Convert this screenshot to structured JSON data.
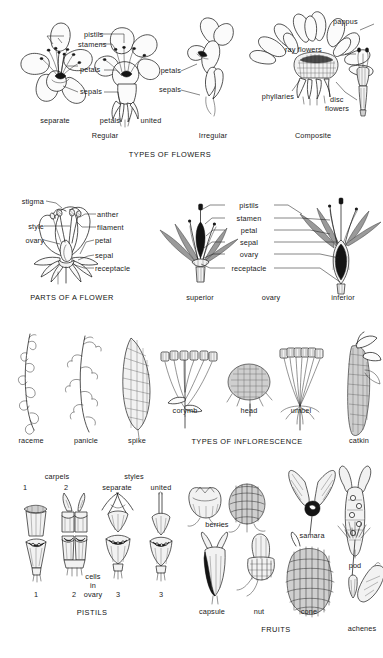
{
  "page": {
    "background": "#ffffff",
    "ink_color": "#1b1b1b"
  },
  "sections": [
    {
      "id": "types-of-flowers",
      "heading": "TYPES OF FLOWERS",
      "subgroups": [
        "Regular",
        "Irregular",
        "Composite"
      ],
      "specimens": [
        "separate",
        "petals",
        "united"
      ],
      "callouts": [
        "pistils",
        "stamens",
        "petals",
        "sepals",
        "petals",
        "sepals",
        "pappus",
        "ray flowers",
        "phyllaries",
        "disc",
        "flowers"
      ]
    },
    {
      "id": "parts-of-a-flower",
      "heading": "PARTS OF A FLOWER",
      "callouts": [
        "stigma",
        "style",
        "ovary",
        "anther",
        "filament",
        "petal",
        "sepal",
        "receptacle"
      ]
    },
    {
      "id": "ovary-position",
      "heading": "ovary",
      "specimens": [
        "superior",
        "inferior"
      ],
      "callouts": [
        "pistils",
        "stamen",
        "petal",
        "sepal",
        "ovary",
        "receptacle"
      ]
    },
    {
      "id": "types-of-inflorescence",
      "heading": "TYPES OF INFLORESCENCE",
      "specimens": [
        "raceme",
        "panicle",
        "spike",
        "corymb",
        "head",
        "umbel",
        "catkin"
      ]
    },
    {
      "id": "pistils",
      "heading": "PISTILS",
      "group_labels": [
        "carpels",
        "styles"
      ],
      "style_types": [
        "separate",
        "united"
      ],
      "top_numbers": [
        "1",
        "2"
      ],
      "bottom_numbers": [
        "1",
        "2",
        "3",
        "3"
      ],
      "cells_label": [
        "cells",
        "in",
        "ovary"
      ]
    },
    {
      "id": "fruits",
      "heading": "FRUITS",
      "specimens": [
        "berries",
        "samara",
        "pod",
        "capsule",
        "nut",
        "cone",
        "achenes"
      ]
    }
  ],
  "labels": {
    "flowers": {
      "pistils": "pistils",
      "stamens": "stamens",
      "petals": "petals",
      "sepals": "sepals",
      "separate": "separate",
      "petals_mid": "petals",
      "united": "united",
      "regular": "Regular",
      "irregular_petals": "petals",
      "irregular_sepals": "sepals",
      "irregular": "Irregular",
      "pappus": "pappus",
      "ray_flowers": "ray flowers",
      "phyllaries": "phyllaries",
      "disc": "disc",
      "flowers": "flowers",
      "composite": "Composite",
      "heading": "TYPES OF FLOWERS"
    },
    "parts": {
      "stigma": "stigma",
      "style": "style",
      "ovary": "ovary",
      "anther": "anther",
      "filament": "filament",
      "petal": "petal",
      "sepal": "sepal",
      "receptacle": "receptacle",
      "heading": "PARTS OF A FLOWER"
    },
    "ovary": {
      "pistils": "pistils",
      "stamen": "stamen",
      "petal": "petal",
      "sepal": "sepal",
      "ovary": "ovary",
      "receptacle": "receptacle",
      "superior": "superior",
      "heading": "ovary",
      "inferior": "inferior"
    },
    "inflorescence": {
      "raceme": "raceme",
      "panicle": "panicle",
      "spike": "spike",
      "corymb": "corymb",
      "head": "head",
      "umbel": "umbel",
      "catkin": "catkin",
      "heading": "TYPES OF INFLORESCENCE"
    },
    "pistils": {
      "carpels": "carpels",
      "styles": "styles",
      "n1_top": "1",
      "n2_top": "2",
      "separate": "separate",
      "united": "united",
      "cells": "cells",
      "in": "in",
      "ovary": "ovary",
      "n1_bot": "1",
      "n2_bot": "2",
      "n3_bot": "3",
      "n3b_bot": "3",
      "heading": "PISTILS"
    },
    "fruits": {
      "berries": "berries",
      "samara": "samara",
      "pod": "pod",
      "capsule": "capsule",
      "nut": "nut",
      "cone": "cone",
      "achenes": "achenes",
      "heading": "FRUITS"
    }
  }
}
